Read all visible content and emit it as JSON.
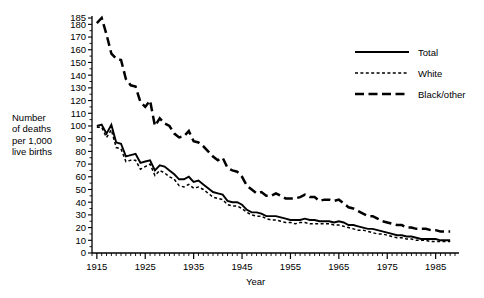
{
  "chart_data": {
    "type": "line",
    "title": "",
    "xlabel": "Year",
    "ylabel": "Number\nof deaths\nper 1,000\nlive births",
    "xlim": [
      1914,
      1989
    ],
    "ylim": [
      0,
      185
    ],
    "grid": false,
    "legend_position": "top-right",
    "x_ticks": [
      1915,
      1925,
      1935,
      1945,
      1955,
      1965,
      1975,
      1985
    ],
    "x_tick_labels": [
      "1915",
      "1925",
      "1935",
      "1945",
      "1955",
      "1965",
      "1975",
      "1985"
    ],
    "x_minor_tick_step": 1,
    "y_ticks": [
      0,
      10,
      20,
      30,
      40,
      50,
      60,
      70,
      80,
      90,
      100,
      110,
      120,
      130,
      140,
      150,
      160,
      170,
      180,
      185
    ],
    "y_tick_labels": [
      "0",
      "10",
      "20",
      "30",
      "40",
      "50",
      "60",
      "70",
      "80",
      "90",
      "100",
      "110",
      "120",
      "130",
      "140",
      "150",
      "160",
      "170",
      "180",
      "185"
    ],
    "x": [
      1915,
      1916,
      1917,
      1918,
      1919,
      1920,
      1921,
      1922,
      1923,
      1924,
      1925,
      1926,
      1927,
      1928,
      1929,
      1930,
      1931,
      1932,
      1933,
      1934,
      1935,
      1936,
      1937,
      1938,
      1939,
      1940,
      1941,
      1942,
      1943,
      1944,
      1945,
      1946,
      1947,
      1948,
      1949,
      1950,
      1951,
      1952,
      1953,
      1954,
      1955,
      1956,
      1957,
      1958,
      1959,
      1960,
      1961,
      1962,
      1963,
      1964,
      1965,
      1966,
      1967,
      1968,
      1969,
      1970,
      1971,
      1972,
      1973,
      1974,
      1975,
      1976,
      1977,
      1978,
      1979,
      1980,
      1981,
      1982,
      1983,
      1984,
      1985,
      1986,
      1987,
      1988
    ],
    "series": [
      {
        "name": "Total",
        "style": "solid",
        "color": "#000000",
        "values": [
          100,
          101,
          94,
          101,
          87,
          86,
          76,
          77,
          78,
          71,
          72,
          73,
          65,
          69,
          68,
          65,
          62,
          58,
          58,
          60,
          56,
          57,
          54,
          51,
          48,
          47,
          46,
          41,
          40,
          40,
          38,
          34,
          32,
          32,
          31,
          29,
          29,
          29,
          28,
          27,
          26,
          26,
          26,
          27,
          26,
          26,
          25,
          25,
          25,
          24,
          25,
          24,
          22,
          22,
          21,
          20,
          19,
          19,
          18,
          17,
          16,
          15,
          14,
          14,
          13,
          13,
          12,
          11,
          11,
          11,
          11,
          10,
          10,
          10
        ]
      },
      {
        "name": "White",
        "style": "dotted",
        "color": "#000000",
        "values": [
          99,
          99,
          91,
          97,
          83,
          82,
          72,
          73,
          73,
          66,
          68,
          70,
          61,
          65,
          63,
          60,
          58,
          53,
          52,
          54,
          51,
          52,
          50,
          47,
          44,
          43,
          42,
          38,
          37,
          37,
          35,
          32,
          30,
          29,
          29,
          27,
          26,
          26,
          25,
          24,
          24,
          23,
          24,
          24,
          23,
          23,
          23,
          23,
          23,
          22,
          22,
          21,
          20,
          19,
          18,
          18,
          17,
          16,
          15,
          15,
          14,
          13,
          12,
          12,
          11,
          11,
          10,
          10,
          10,
          9,
          9,
          9,
          9,
          9
        ]
      },
      {
        "name": "Black/other",
        "style": "dashed",
        "color": "#000000",
        "values": [
          181,
          185,
          172,
          157,
          153,
          152,
          137,
          132,
          131,
          119,
          115,
          120,
          100,
          106,
          102,
          100,
          94,
          91,
          92,
          96,
          88,
          87,
          84,
          80,
          76,
          73,
          75,
          67,
          65,
          64,
          60,
          53,
          50,
          47,
          48,
          45,
          45,
          47,
          45,
          43,
          43,
          43,
          44,
          46,
          44,
          44,
          41,
          42,
          42,
          41,
          42,
          39,
          36,
          35,
          33,
          31,
          29,
          29,
          27,
          25,
          24,
          23,
          22,
          22,
          20,
          20,
          19,
          19,
          19,
          18,
          18,
          17,
          17,
          17
        ]
      }
    ]
  },
  "legend": {
    "entries": [
      {
        "label": "Total",
        "style": "solid"
      },
      {
        "label": "White",
        "style": "dotted"
      },
      {
        "label": "Black/other",
        "style": "dashed"
      }
    ]
  }
}
